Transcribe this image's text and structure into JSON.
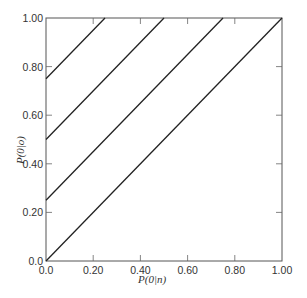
{
  "chart_data": {
    "type": "line",
    "title": "",
    "xlabel": "P(0|n)",
    "ylabel": "P(0|o)",
    "xlim": [
      0,
      1
    ],
    "ylim": [
      0,
      1
    ],
    "grid": false,
    "legend": null,
    "x_ticks": [
      0,
      0.2,
      0.4,
      0.6,
      0.8,
      1.0
    ],
    "x_tick_labels": [
      "0.0",
      "0.20",
      "0.40",
      "0.60",
      "0.80",
      "1.00"
    ],
    "y_ticks": [
      0,
      0.2,
      0.4,
      0.6,
      0.8,
      1.0
    ],
    "y_tick_labels": [
      "0.0",
      "0.20",
      "0.40",
      "0.60",
      "0.80",
      "1.00"
    ],
    "series": [
      {
        "name": "line-intercept-0.75",
        "x": [
          0,
          0.25
        ],
        "y": [
          0.75,
          1.0
        ]
      },
      {
        "name": "line-intercept-0.50",
        "x": [
          0,
          0.5
        ],
        "y": [
          0.5,
          1.0
        ]
      },
      {
        "name": "line-intercept-0.25",
        "x": [
          0,
          0.75
        ],
        "y": [
          0.25,
          1.0
        ]
      },
      {
        "name": "line-intercept-0.00",
        "x": [
          0,
          1.0
        ],
        "y": [
          0.0,
          1.0
        ]
      }
    ]
  }
}
